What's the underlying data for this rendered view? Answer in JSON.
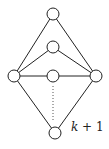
{
  "diagram": {
    "type": "graph",
    "nodes": [
      {
        "id": "top",
        "x": 53,
        "y": 14
      },
      {
        "id": "second",
        "x": 53,
        "y": 47
      },
      {
        "id": "middle",
        "x": 53,
        "y": 76
      },
      {
        "id": "left",
        "x": 14,
        "y": 76
      },
      {
        "id": "right",
        "x": 96,
        "y": 76
      },
      {
        "id": "bottom",
        "x": 55,
        "y": 133
      }
    ],
    "edges": [
      [
        "left",
        "top"
      ],
      [
        "top",
        "right"
      ],
      [
        "left",
        "second"
      ],
      [
        "second",
        "right"
      ],
      [
        "left",
        "middle"
      ],
      [
        "middle",
        "right"
      ],
      [
        "left",
        "bottom"
      ],
      [
        "bottom",
        "right"
      ]
    ],
    "dotted_edges": [
      [
        "middle",
        "bottom"
      ]
    ],
    "label": {
      "var": "k",
      "rest": " + 1"
    },
    "colors": {
      "stroke": "#222222",
      "background": "#ffffff"
    }
  }
}
